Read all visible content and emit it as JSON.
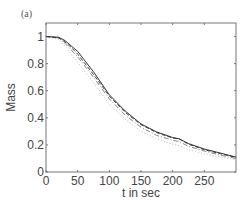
{
  "panel_label": "(a)",
  "chart_data": {
    "type": "line",
    "title": "",
    "xlabel": "t in sec",
    "ylabel": "Mass",
    "xlim": [
      0,
      300
    ],
    "ylim": [
      0,
      1.1
    ],
    "xticks": [
      0,
      50,
      100,
      150,
      200,
      250
    ],
    "yticks": [
      0,
      0.2,
      0.4,
      0.6,
      0.8,
      1
    ],
    "xtick_labels": [
      "0",
      "50",
      "100",
      "150",
      "200",
      "250"
    ],
    "ytick_labels": [
      "0",
      "0.2",
      "0.4",
      "0.6",
      "0.8",
      "1"
    ],
    "grid": false,
    "legend": null,
    "x": [
      0,
      20,
      30,
      40,
      50,
      60,
      75,
      100,
      125,
      150,
      175,
      200,
      210,
      225,
      250,
      275,
      300
    ],
    "series": [
      {
        "name": "solid",
        "style": "solid",
        "color": "#333333",
        "values": [
          1.0,
          0.995,
          0.97,
          0.93,
          0.89,
          0.83,
          0.74,
          0.57,
          0.45,
          0.355,
          0.295,
          0.255,
          0.245,
          0.21,
          0.17,
          0.14,
          0.11
        ]
      },
      {
        "name": "dashed",
        "style": "dashed",
        "color": "#444444",
        "values": [
          1.0,
          0.99,
          0.96,
          0.92,
          0.87,
          0.81,
          0.72,
          0.56,
          0.44,
          0.35,
          0.29,
          0.25,
          0.245,
          0.205,
          0.165,
          0.135,
          0.108
        ]
      },
      {
        "name": "dash-dot",
        "style": "dashdot",
        "color": "#888888",
        "values": [
          1.0,
          0.99,
          0.95,
          0.9,
          0.85,
          0.79,
          0.7,
          0.54,
          0.42,
          0.33,
          0.27,
          0.235,
          0.225,
          0.19,
          0.155,
          0.125,
          0.1
        ]
      },
      {
        "name": "dotted",
        "style": "dotted",
        "color": "#bbbbbb",
        "values": [
          1.0,
          0.98,
          0.93,
          0.87,
          0.81,
          0.75,
          0.66,
          0.5,
          0.39,
          0.3,
          0.245,
          0.205,
          0.195,
          0.165,
          0.135,
          0.11,
          0.09
        ]
      }
    ]
  }
}
